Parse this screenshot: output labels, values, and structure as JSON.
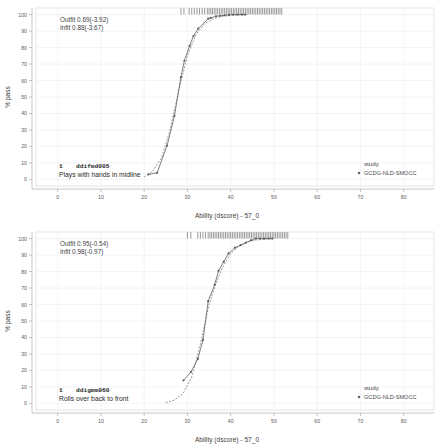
{
  "figure": {
    "type": "multi-panel-icc",
    "panel_count": 2,
    "width": 442,
    "height": 448
  },
  "shared": {
    "xlabel": "Ability (dscore) - 57_0",
    "ylabel": "% pass",
    "xticks": [
      "0",
      "10",
      "20",
      "30",
      "40",
      "50",
      "60",
      "70",
      "80"
    ],
    "yticks": [
      "0",
      "10",
      "20",
      "30",
      "40",
      "50",
      "60",
      "70",
      "80",
      "90",
      "100"
    ],
    "xlim": [
      -5,
      87
    ],
    "ylim": [
      -4,
      104
    ],
    "legend_title": "study",
    "legend_entries": [
      "GCDG-NLD-SMOCC"
    ],
    "grid": true,
    "accent_color": "#5e5e5e",
    "grid_color": "#e3e3ef"
  },
  "panels": [
    {
      "id": "panel-top",
      "item_number": "1",
      "item_code": "ddifmd005",
      "item_description": "Plays with hands in midline",
      "outfit_label": "Outfit 0.69(-3.92)",
      "infit_label": "Infit  0.88(-3.67)",
      "outfit_value": 0.69,
      "outfit_t": -3.92,
      "infit_value": 0.88,
      "infit_t": -3.67,
      "chart_data": {
        "type": "line",
        "title": "ddifmd005 - Plays with hands in midline",
        "xlabel": "Ability (dscore) - 57_0",
        "ylabel": "% pass",
        "xlim": [
          -5,
          87
        ],
        "ylim": [
          -4,
          104
        ],
        "grid": true,
        "legend_position": "right",
        "series": [
          {
            "name": "GCDG-NLD-SMOCC",
            "style": "solid-with-markers",
            "x": [
              21.0,
              23.0,
              25.3,
              27.0,
              28.5,
              29.3,
              30.5,
              31.4,
              32.5,
              34.8,
              35.4,
              36.6,
              37.6,
              38.6,
              39.6,
              40.6,
              41.6,
              42.6,
              43.3
            ],
            "y": [
              3.0,
              4.0,
              20.5,
              38.5,
              62.0,
              72.0,
              81.0,
              87.0,
              91.5,
              97.5,
              98.0,
              99.0,
              99.3,
              99.6,
              99.8,
              100.0,
              100.0,
              100.0,
              100.0
            ]
          },
          {
            "name": "Rasch model",
            "style": "dashed",
            "x": [
              20.0,
              22.0,
              24.0,
              26.0,
              28.0,
              30.0,
              32.0,
              34.0,
              36.0,
              38.0,
              40.0,
              42.0,
              44.0
            ],
            "y": [
              1.5,
              5.0,
              13.0,
              30.0,
              54.0,
              75.0,
              88.0,
              94.5,
              97.5,
              98.9,
              99.5,
              99.8,
              100.0
            ]
          }
        ],
        "rug": {
          "label": "ability distribution",
          "y": 102,
          "x": [
            28.5,
            29.2,
            30.4,
            31.0,
            31.6,
            32.2,
            32.8,
            33.4,
            34.0,
            34.6,
            35.0,
            35.4,
            35.8,
            36.2,
            36.6,
            37.0,
            37.4,
            37.8,
            38.2,
            38.6,
            39.0,
            39.4,
            39.8,
            40.2,
            40.6,
            41.0,
            41.4,
            41.8,
            42.2,
            42.6,
            43.0,
            43.4,
            43.8,
            44.2,
            44.6,
            45.0,
            45.4,
            45.8,
            46.2,
            46.6,
            47.0,
            47.4,
            47.8,
            48.2,
            48.6,
            49.0,
            49.4,
            49.8,
            50.2,
            50.6,
            51.0,
            51.4,
            51.8
          ]
        }
      }
    },
    {
      "id": "panel-bottom",
      "item_number": "1",
      "item_code": "ddigmm060",
      "item_description": "Rolls over back to front",
      "outfit_label": "Outfit 0.95(-0.54)",
      "infit_label": "Infit  0.98(-0.97)",
      "outfit_value": 0.95,
      "outfit_t": -0.54,
      "infit_value": 0.98,
      "infit_t": -0.97,
      "chart_data": {
        "type": "line",
        "title": "ddigmm060 - Rolls over back to front",
        "xlabel": "Ability (dscore) - 57_0",
        "ylabel": "% pass",
        "xlim": [
          -5,
          87
        ],
        "ylim": [
          -4,
          104
        ],
        "grid": true,
        "legend_position": "right",
        "series": [
          {
            "name": "GCDG-NLD-SMOCC",
            "style": "solid-with-markers",
            "x": [
              29.1,
              30.8,
              32.4,
              33.6,
              34.8,
              36.3,
              37.2,
              38.4,
              39.5,
              41.0,
              42.3,
              43.5,
              44.7,
              45.8,
              46.8,
              47.8,
              48.8,
              49.6
            ],
            "y": [
              14.0,
              19.0,
              27.0,
              38.5,
              62.0,
              72.0,
              80.5,
              86.0,
              91.0,
              94.5,
              96.0,
              97.5,
              99.0,
              100.0,
              100.0,
              100.0,
              100.0,
              100.0
            ]
          },
          {
            "name": "Rasch model",
            "style": "dashed",
            "x": [
              25.0,
              27.0,
              29.0,
              31.0,
              33.0,
              35.0,
              36.5,
              38.0,
              40.0,
              42.0,
              44.0,
              46.0,
              48.0,
              50.0
            ],
            "y": [
              0.5,
              2.0,
              6.0,
              16.0,
              36.0,
              60.0,
              72.0,
              82.0,
              91.0,
              95.5,
              98.0,
              99.2,
              99.7,
              100.0
            ]
          }
        ],
        "rug": {
          "label": "ability distribution",
          "y": 102,
          "x": [
            30.0,
            30.8,
            32.4,
            33.0,
            33.6,
            34.2,
            34.8,
            35.2,
            35.6,
            36.0,
            36.4,
            36.8,
            37.2,
            37.6,
            38.0,
            38.4,
            38.8,
            39.2,
            39.6,
            40.0,
            40.4,
            40.8,
            41.2,
            41.6,
            42.0,
            42.4,
            42.8,
            43.2,
            43.6,
            44.0,
            44.4,
            44.8,
            45.2,
            45.6,
            46.0,
            46.4,
            46.8,
            47.2,
            47.6,
            48.0,
            48.4,
            48.8,
            49.2,
            49.6,
            50.0,
            50.4,
            50.8,
            51.2,
            51.6,
            52.0,
            52.4,
            52.8,
            53.2
          ]
        }
      }
    }
  ]
}
